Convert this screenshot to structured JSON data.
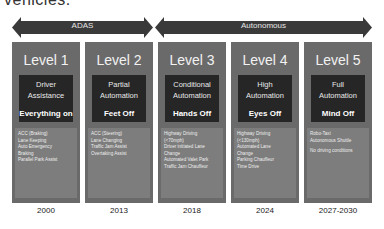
{
  "header": {
    "partial_text": "vehicles."
  },
  "arrows": [
    {
      "label": "ADAS"
    },
    {
      "label": "Autonomous"
    }
  ],
  "levels": [
    {
      "level": "Level 1",
      "name_line1": "Driver",
      "name_line2": "Assistance",
      "tag": "Everything on",
      "features": [
        "ACC (Braking)",
        "Lane Keeping",
        "Auto Emergency",
        "Braking",
        "Parallel Park Assist"
      ],
      "year": "2000"
    },
    {
      "level": "Level 2",
      "name_line1": "Partial",
      "name_line2": "Automation",
      "tag": "Feet Off",
      "features": [
        "ACC (Steering)",
        "Lane Changing",
        "Traffic Jam Assist",
        "Overtaking Assist"
      ],
      "year": "2013"
    },
    {
      "level": "Level 3",
      "name_line1": "Conditional",
      "name_line2": "Automation",
      "tag": "Hands Off",
      "features": [
        "Highway Driving",
        "(<70mph)",
        "Driver initiated Lane",
        "Change",
        "Automated Valet Park",
        "Traffic Jam Chauffeur"
      ],
      "year": "2018"
    },
    {
      "level": "Level 4",
      "name_line1": "High",
      "name_line2": "Automation",
      "tag": "Eyes Off",
      "features": [
        "Highway Driving",
        "(<130mph)",
        "Automated Lane",
        "Change",
        "Parking Chauffeur",
        "Time Drive"
      ],
      "year": "2024"
    },
    {
      "level": "Level 5",
      "name_line1": "Full",
      "name_line2": "Automation",
      "tag": "Mind Off",
      "features": [
        "Robo-Taxi",
        "Autonomous Shuttle",
        "",
        "No driving conditions"
      ],
      "year": "2027-2030"
    }
  ],
  "colors": {
    "arrow": "#3a3a3a",
    "column": "#6a6a6a",
    "box": "#262626",
    "features": "#7d7d7d"
  }
}
